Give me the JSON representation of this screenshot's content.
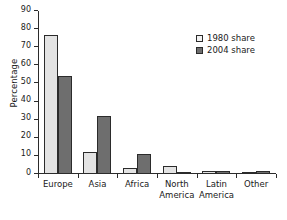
{
  "chart_data": {
    "type": "bar",
    "title": "",
    "subtitle": "",
    "xlabel": "",
    "ylabel": "Percentage",
    "ylim": [
      0,
      90
    ],
    "ytick_step": 10,
    "yticks": [
      0,
      10,
      20,
      30,
      40,
      50,
      60,
      70,
      80,
      90
    ],
    "grid": false,
    "legend_position": "top-right",
    "categories": [
      "Europe",
      "Asia",
      "Africa",
      "North America",
      "Latin America",
      "Other"
    ],
    "category_lines": [
      [
        "Europe"
      ],
      [
        "Asia"
      ],
      [
        "Africa"
      ],
      [
        "North",
        "America"
      ],
      [
        "Latin",
        "America"
      ],
      [
        "Other"
      ]
    ],
    "series": [
      {
        "name": "1980 share",
        "color": "#e3e3e3",
        "values": [
          77,
          12,
          3.5,
          4.5,
          1.5,
          0.5
        ]
      },
      {
        "name": "2004 share",
        "color": "#6e6e6e",
        "values": [
          54,
          32,
          11,
          1.2,
          1.5,
          1.5
        ]
      }
    ]
  },
  "legend": {
    "items": [
      {
        "label": "1980 share",
        "swatch": "light-gray-swatch"
      },
      {
        "label": "2004 share",
        "swatch": "dark-gray-swatch"
      }
    ]
  },
  "axis": {
    "y_title": "Percentage"
  }
}
